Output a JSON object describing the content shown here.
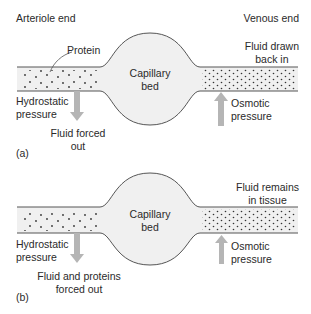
{
  "header": {
    "left_title": "Arteriole end",
    "right_title": "Venous end"
  },
  "panel_a": {
    "tag": "(a)",
    "protein_label": "Protein",
    "center_label_line1": "Capillary",
    "center_label_line2": "bed",
    "left_pressure_line1": "Hydrostatic",
    "left_pressure_line2": "pressure",
    "left_arrow_line1": "Fluid forced",
    "left_arrow_line2": "out",
    "right_top_line1": "Fluid drawn",
    "right_top_line2": "back in",
    "right_pressure_line1": "Osmotic",
    "right_pressure_line2": "pressure"
  },
  "panel_b": {
    "tag": "(b)",
    "center_label_line1": "Capillary",
    "center_label_line2": "bed",
    "left_pressure_line1": "Hydrostatic",
    "left_pressure_line2": "pressure",
    "left_arrow_line1": "Fluid and proteins",
    "left_arrow_line2": "forced out",
    "right_top_line1": "Fluid remains",
    "right_top_line2": "in tissue",
    "right_pressure_line1": "Osmotic",
    "right_pressure_line2": "pressure"
  },
  "colors": {
    "vessel_fill": "#f0f0f0",
    "outline": "#555555",
    "arrow": "#b5b5b5",
    "dot": "#333333"
  }
}
